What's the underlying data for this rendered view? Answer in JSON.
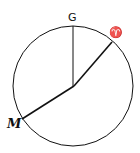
{
  "diagram": {
    "labels": {
      "top": "G",
      "aries": "♈",
      "left": "M"
    },
    "colors": {
      "stroke": "#111111",
      "background": "#ffffff"
    }
  }
}
